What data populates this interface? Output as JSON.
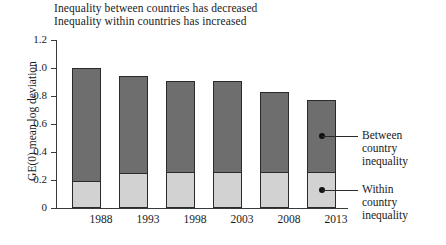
{
  "subtitle": {
    "line1": "Inequality between countries has decreased",
    "line2": "Inequality within countries has increased"
  },
  "axes": {
    "ylabel": "GE(0) mean log deviation",
    "yticks": [
      "1.2",
      "1.0",
      "0.8",
      "0.6",
      "0.4",
      "0.2",
      "0"
    ]
  },
  "annotations": {
    "between": "Between\ncountry\ninequality",
    "between_line1": "Between",
    "between_line2": "country",
    "between_line3": "inequality",
    "within_line1": "Within",
    "within_line2": "country",
    "within_line3": "inequality"
  },
  "colors": {
    "between": "#6e6e6e",
    "within": "#d2d2d2",
    "outline": "#2b2b2b",
    "axis": "#3a3a3a"
  },
  "chart_data": {
    "type": "bar",
    "subtype": "stacked-bar",
    "xlabel": "",
    "ylabel": "GE(0) mean log deviation",
    "ylim": [
      0,
      1.2
    ],
    "ytick_values": [
      1.2,
      1.0,
      0.8,
      0.6,
      0.4,
      0.2,
      0
    ],
    "grid": false,
    "legend_position": "right-callout",
    "categories": [
      "1988",
      "1993",
      "1998",
      "2003",
      "2008",
      "2013"
    ],
    "series": [
      {
        "name": "Within country inequality",
        "color": "#d2d2d2",
        "values": [
          0.19,
          0.25,
          0.26,
          0.26,
          0.26,
          0.26
        ]
      },
      {
        "name": "Between country inequality",
        "color": "#6e6e6e",
        "values": [
          0.81,
          0.69,
          0.65,
          0.65,
          0.57,
          0.51
        ]
      }
    ],
    "totals": [
      1.0,
      0.94,
      0.91,
      0.91,
      0.83,
      0.77
    ]
  }
}
